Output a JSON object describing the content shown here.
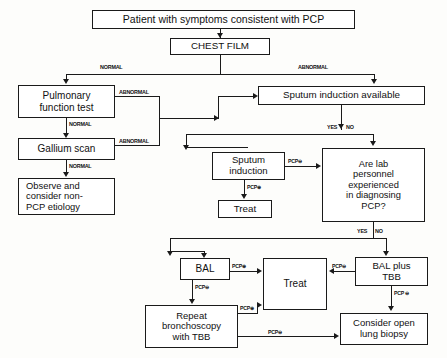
{
  "diagram": {
    "nodes": {
      "patient": "Patient with symptoms consistent with PCP",
      "chest_film": "CHEST FILM",
      "pulmonary": "Pulmonary\nfunction test",
      "pulmonary_l1": "Pulmonary",
      "pulmonary_l2": "function test",
      "gallium": "Gallium scan",
      "observe_l1": "Observe and",
      "observe_l2": "consider non-",
      "observe_l3": "PCP etiology",
      "sputum_available": "Sputum induction available",
      "sputum_induction_l1": "Sputum",
      "sputum_induction_l2": "induction",
      "treat_upper": "Treat",
      "lab_l1": "Are lab",
      "lab_l2": "personnel",
      "lab_l3": "experienced",
      "lab_l4": "in diagnosing",
      "lab_l5": "PCP?",
      "bal": "BAL",
      "treat_lower": "Treat",
      "bal_plus_tbb_l1": "BAL plus",
      "bal_plus_tbb_l2": "TBB",
      "repeat_l1": "Repeat",
      "repeat_l2": "bronchoscopy",
      "repeat_l3": "with TBB",
      "open_biopsy_l1": "Consider open",
      "open_biopsy_l2": "lung biopsy"
    },
    "edge_labels": {
      "normal_left": "NORMAL",
      "abnormal_right": "ABNORMAL",
      "abnormal_pulmonary": "ABNORMAL",
      "normal_pulmonary": "NORMAL",
      "abnormal_gallium": "ABNORMAL",
      "normal_gallium": "NORMAL",
      "yes_sputum": "YES",
      "no_sputum": "NO",
      "pcp_neg_sputum": "PCP⊖",
      "pcp_pos_sputum": "PCP⊕",
      "yes_lab": "YES",
      "no_lab": "NO",
      "pcp_pos_bal": "PCP⊕",
      "pcp_neg_bal": "PCP⊖",
      "pcp_neg_baltbb_treat": "PCP⊖",
      "pcp_neg_baltbb_biopsy": "PCP ⊖",
      "pcp_pos_repeat": "PCP⊕",
      "pcp_neg_repeat": "PCP⊖"
    },
    "colors": {
      "line": "#1a1a1a",
      "box_fill": "#ffffff",
      "text": "#111111",
      "background": "#fdfdfb"
    }
  }
}
